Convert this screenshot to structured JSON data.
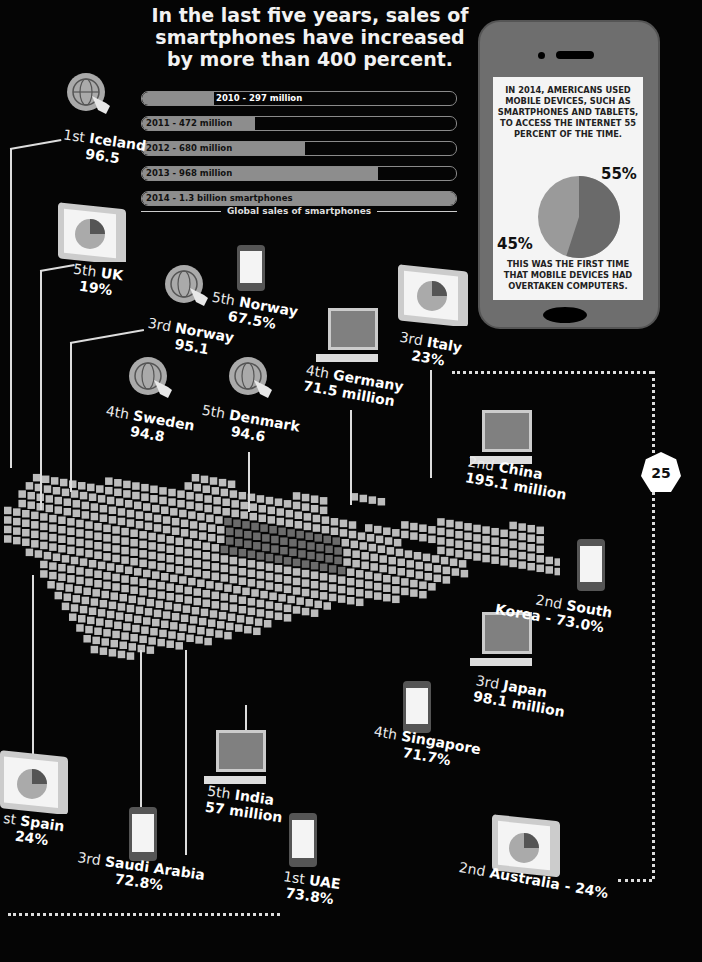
{
  "headline": "In the last five years, sales of smartphones have increased by more than 400 percent.",
  "chart_data": {
    "type": "bar",
    "title": "Global sales of smartphones",
    "categories": [
      "2010",
      "2011",
      "2012",
      "2013",
      "2014"
    ],
    "values": [
      297,
      472,
      680,
      968,
      1300
    ],
    "unit": "million",
    "labels": [
      "2010 - 297 million",
      "2011 - 472 million",
      "2012 - 680 million",
      "2013 - 968 million",
      "2014 - 1.3 billion smartphones"
    ],
    "fill_pct": [
      23,
      36,
      52,
      75,
      100
    ]
  },
  "sales_caption": "Global sales of smartphones",
  "phone_panel": {
    "top_text": "IN 2014, AMERICANS USED MOBILE DEVICES, SUCH AS SMARTPHONES AND TABLETS, TO ACCESS THE INTERNET 55 PERCENT OF THE TIME.",
    "pie": [
      {
        "label": "55%",
        "value": 55,
        "color": "#6a6a6a"
      },
      {
        "label": "45%",
        "value": 45,
        "color": "#9a9a9a"
      }
    ],
    "pct_55": "55%",
    "pct_45": "45%",
    "bottom_text": "THIS WAS THE FIRST TIME THAT MOBILE DEVICES HAD OVERTAKEN COMPUTERS."
  },
  "page_number": "25",
  "labels": {
    "iceland": {
      "rank": "1st",
      "country": "Iceland",
      "value": "96.5",
      "icon": "globe-click-icon"
    },
    "uk": {
      "rank": "5th",
      "country": "UK",
      "value": "19%",
      "icon": "tablet-pie-icon"
    },
    "norway5": {
      "rank": "5th",
      "country": "Norway",
      "value": "67.5%",
      "icon": "smartphone-icon"
    },
    "norway3": {
      "rank": "3rd",
      "country": "Norway",
      "value": "95.1",
      "icon": "globe-click-icon"
    },
    "italy": {
      "rank": "3rd",
      "country": "Italy",
      "value": "23%",
      "icon": "tablet-pie-icon"
    },
    "germany": {
      "rank": "4th",
      "country": "Germany",
      "value": "71.5 million",
      "icon": "desktop-computer-icon"
    },
    "sweden": {
      "rank": "4th",
      "country": "Sweden",
      "value": "94.8",
      "icon": "globe-click-icon"
    },
    "denmark": {
      "rank": "5th",
      "country": "Denmark",
      "value": "94.6",
      "icon": "globe-click-icon"
    },
    "china": {
      "rank": "2nd",
      "country": "China",
      "value": "195.1 million",
      "icon": "desktop-computer-icon"
    },
    "skorea": {
      "rank": "2nd",
      "country": "South",
      "country2": "Korea - 73.0%",
      "icon": "smartphone-icon"
    },
    "japan": {
      "rank": "3rd",
      "country": "Japan",
      "value": "98.1 million",
      "icon": "desktop-computer-icon"
    },
    "singapore": {
      "rank": "4th",
      "country": "Singapore",
      "value": "71.7%",
      "icon": "smartphone-icon"
    },
    "india": {
      "rank": "5th",
      "country": "India",
      "value": "57 million",
      "icon": "desktop-computer-icon"
    },
    "spain": {
      "rank": "st",
      "country": "Spain",
      "value": "24%",
      "icon": "tablet-pie-icon"
    },
    "saudi": {
      "rank": "3rd",
      "country": "Saudi Arabia",
      "value": "72.8%",
      "icon": "smartphone-icon"
    },
    "uae": {
      "rank": "1st",
      "country": "UAE",
      "value": "73.8%",
      "icon": "smartphone-icon"
    },
    "australia": {
      "rank": "2nd",
      "country": "Australia - 24%",
      "icon": "tablet-pie-icon"
    }
  },
  "colors": {
    "background": "#050505",
    "map_tile": "#bdbdbd",
    "map_tile_dark": "#6a6a6a",
    "bar_fill": "#8d8d8d",
    "text": "#ffffff"
  }
}
